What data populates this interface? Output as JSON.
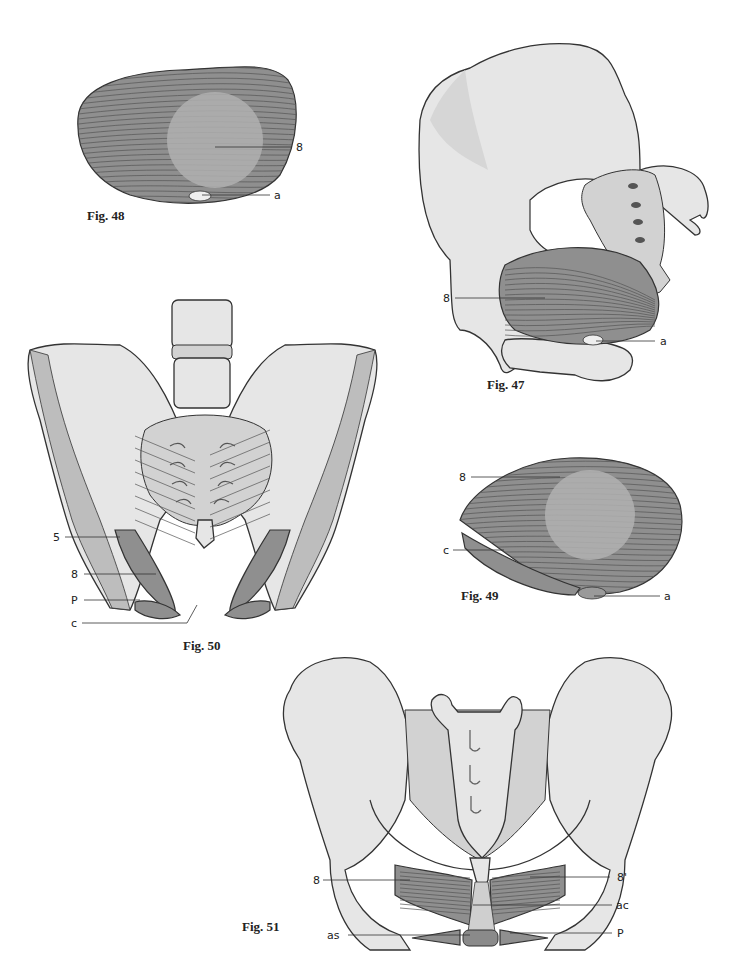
{
  "page": {
    "colors": {
      "bone": "#e6e6e6",
      "bone_shade": "#d2d2d2",
      "muscle": "#8f8f8f",
      "outline": "#333333",
      "background": "#ffffff"
    }
  },
  "figures": {
    "fig48": {
      "caption": "Fig. 48",
      "labels": {
        "muscle": "8",
        "opening": "a"
      }
    },
    "fig47": {
      "caption": "Fig. 47",
      "labels": {
        "muscle": "8",
        "opening": "a"
      }
    },
    "fig50": {
      "caption": "Fig. 50",
      "labels": {
        "l5": "5",
        "l8": "8",
        "lP": "P",
        "lc": "c"
      }
    },
    "fig49": {
      "caption": "Fig. 49",
      "labels": {
        "muscle": "8",
        "cleft": "c",
        "opening": "a"
      }
    },
    "fig51": {
      "caption": "Fig. 51",
      "labels": {
        "l8": "8",
        "l8p": "8'",
        "lac": "ac",
        "las": "as",
        "lP": "P"
      }
    }
  }
}
